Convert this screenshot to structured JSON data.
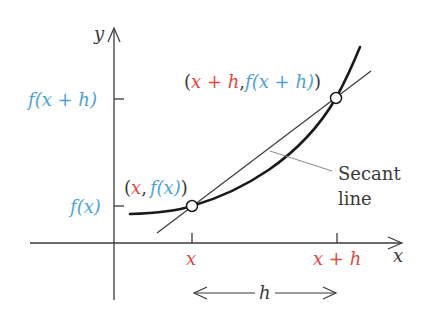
{
  "colors": {
    "axis": "#3a3a3a",
    "curve": "#1a1a1a",
    "secant": "#3a3a3a",
    "leader": "#8a8a8a",
    "function_label": "#4aa3d8",
    "input_label": "#e2483d",
    "text": "#3a3a3a"
  },
  "axes": {
    "x_label": "x",
    "y_label": "y"
  },
  "y_ticks": {
    "upper": "f(x + h)",
    "lower": "f(x)"
  },
  "x_ticks": {
    "left": "x",
    "right": "x + h"
  },
  "points": {
    "lower": {
      "open": "(",
      "x": "x",
      "comma": ",",
      "y": "f(x)",
      "close": ")"
    },
    "upper": {
      "open": "(",
      "x": "x + h",
      "comma": ",",
      "y": "f(x + h)",
      "close": ")"
    }
  },
  "annotation": {
    "line1": "Secant",
    "line2": "line"
  },
  "interval": {
    "label": "h"
  }
}
